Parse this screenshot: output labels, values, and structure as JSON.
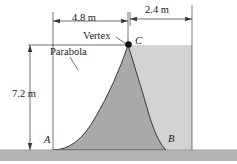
{
  "figure": {
    "kind": "engineering-diagram",
    "colors": {
      "background": "#ffffff",
      "parabola_fill": "#a8a8a8",
      "region_fill": "#d2d2d2",
      "ground_fill": "#b4b4b4",
      "line": "#2b2b2b",
      "text": "#1a1a1a"
    },
    "dimensions": [
      {
        "id": "width-left",
        "label": "4.8 m",
        "value": 4.8,
        "unit": "m",
        "orientation": "horizontal"
      },
      {
        "id": "width-right",
        "label": "2.4 m",
        "value": 2.4,
        "unit": "m",
        "orientation": "horizontal"
      },
      {
        "id": "height",
        "label": "7.2 m",
        "value": 7.2,
        "unit": "m",
        "orientation": "vertical"
      }
    ],
    "annotations": [
      {
        "id": "vertex",
        "label": "Vertex"
      },
      {
        "id": "parabola",
        "label": "Parabola"
      }
    ],
    "points": [
      {
        "id": "A",
        "label": "A",
        "x": 0.0,
        "y": 0.0
      },
      {
        "id": "B",
        "label": "B",
        "x": 7.2,
        "y": 0.0
      },
      {
        "id": "C",
        "label": "C",
        "x": 4.8,
        "y": 7.2,
        "marker": "filled-dot"
      }
    ]
  }
}
